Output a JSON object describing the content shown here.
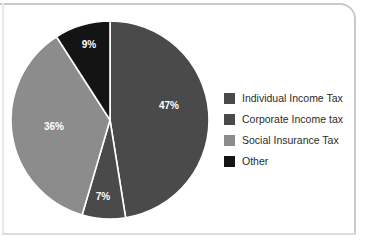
{
  "chart_data": {
    "type": "pie",
    "title": "",
    "labels": [
      "Individual Income Tax",
      "Corporate Income tax",
      "Social Insurance Tax",
      "Other"
    ],
    "values": [
      47,
      7,
      36,
      9
    ],
    "value_labels": [
      "47%",
      "7%",
      "36%",
      "9%"
    ],
    "colors": [
      "#4a4a4a",
      "#4a4a4a",
      "#8c8c8c",
      "#141414"
    ],
    "legend_position": "right",
    "grid": false,
    "xlabel": "",
    "ylabel": "",
    "slice_separator_color": "#ffffff",
    "label_text_color": "#ffffff"
  },
  "legend": {
    "items": [
      {
        "label": "Individual Income Tax",
        "color": "#4a4a4a"
      },
      {
        "label": "Corporate Income tax",
        "color": "#4a4a4a"
      },
      {
        "label": "Social Insurance Tax",
        "color": "#8c8c8c"
      },
      {
        "label": "Other",
        "color": "#141414"
      }
    ]
  },
  "slices": [
    {
      "name": "individual-income-tax",
      "percent_label": "47%"
    },
    {
      "name": "corporate-income-tax",
      "percent_label": "7%"
    },
    {
      "name": "social-insurance-tax",
      "percent_label": "36%"
    },
    {
      "name": "other",
      "percent_label": "9%"
    }
  ],
  "frame": {
    "border_color": "#c9c9c9",
    "background": "#ffffff"
  }
}
